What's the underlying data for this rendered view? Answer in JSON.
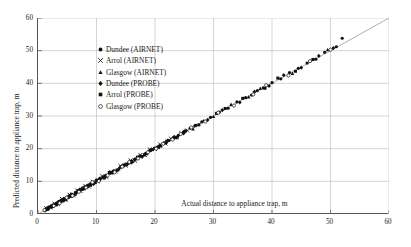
{
  "chart_data": {
    "type": "scatter",
    "title": "",
    "xlabel": "Actual distance to appliance trap, m",
    "ylabel": "Predicted distance to appliance trap, m",
    "xlim": [
      0,
      60
    ],
    "ylim": [
      0,
      60
    ],
    "xticks": [
      0,
      10,
      20,
      30,
      40,
      50,
      60
    ],
    "yticks": [
      0,
      10,
      20,
      30,
      40,
      50,
      60
    ],
    "grid": true,
    "legend_position": "upper-left-inside",
    "reference_line": {
      "name": "1:1 line",
      "from": [
        0,
        0
      ],
      "to": [
        60,
        60
      ],
      "color": "#8c8c8c"
    },
    "series": [
      {
        "name": "Dundee (AIRNET)",
        "marker": "filled-circle",
        "color": "#111111",
        "points": [
          [
            1.2,
            1.0
          ],
          [
            1.5,
            1.4
          ],
          [
            1.8,
            1.6
          ],
          [
            2.0,
            2.2
          ],
          [
            2.3,
            2.1
          ],
          [
            2.6,
            2.8
          ],
          [
            3.0,
            3.1
          ],
          [
            3.2,
            2.9
          ],
          [
            3.5,
            3.6
          ],
          [
            3.8,
            4.0
          ],
          [
            4.0,
            3.8
          ],
          [
            4.3,
            4.5
          ],
          [
            4.6,
            4.4
          ],
          [
            5.0,
            5.2
          ],
          [
            5.2,
            5.0
          ],
          [
            5.5,
            5.7
          ],
          [
            5.8,
            6.0
          ],
          [
            6.0,
            5.8
          ],
          [
            6.4,
            6.6
          ],
          [
            6.8,
            7.0
          ],
          [
            7.2,
            7.4
          ],
          [
            7.6,
            7.5
          ],
          [
            8.0,
            8.3
          ],
          [
            8.4,
            8.2
          ],
          [
            8.8,
            9.0
          ],
          [
            9.2,
            9.4
          ],
          [
            9.6,
            9.5
          ],
          [
            10.0,
            10.4
          ],
          [
            10.6,
            10.6
          ],
          [
            11.2,
            11.4
          ],
          [
            11.8,
            11.9
          ],
          [
            12.4,
            12.5
          ],
          [
            13.0,
            13.2
          ],
          [
            13.6,
            13.5
          ],
          [
            14.2,
            14.4
          ],
          [
            14.8,
            15.0
          ],
          [
            15.4,
            15.5
          ],
          [
            16.0,
            16.2
          ],
          [
            16.8,
            16.9
          ],
          [
            17.6,
            17.7
          ],
          [
            18.4,
            18.6
          ],
          [
            19.2,
            19.4
          ],
          [
            20.0,
            20.2
          ],
          [
            20.8,
            20.9
          ],
          [
            21.6,
            21.8
          ],
          [
            22.4,
            22.5
          ],
          [
            23.2,
            23.4
          ],
          [
            24.0,
            24.1
          ],
          [
            25.0,
            25.2
          ],
          [
            26.0,
            26.3
          ],
          [
            27.0,
            27.1
          ],
          [
            28.0,
            28.2
          ],
          [
            29.5,
            29.6
          ],
          [
            31.0,
            31.2
          ],
          [
            32.5,
            32.4
          ],
          [
            34.0,
            34.3
          ],
          [
            35.5,
            35.6
          ],
          [
            36.5,
            36.4
          ],
          [
            37.5,
            37.8
          ],
          [
            38.5,
            38.6
          ],
          [
            40.0,
            40.2
          ],
          [
            41.5,
            41.4
          ],
          [
            43.0,
            43.3
          ],
          [
            44.5,
            44.6
          ],
          [
            46.0,
            46.2
          ],
          [
            47.5,
            47.4
          ],
          [
            49.0,
            49.5
          ],
          [
            51.0,
            51.2
          ],
          [
            52.0,
            53.8
          ]
        ]
      },
      {
        "name": "Arrol (AIRNET)",
        "marker": "cross",
        "color": "#111111",
        "points": [
          [
            1.4,
            1.8
          ],
          [
            2.1,
            2.0
          ],
          [
            2.8,
            3.2
          ],
          [
            3.4,
            3.0
          ],
          [
            4.1,
            4.6
          ],
          [
            4.7,
            4.3
          ],
          [
            5.4,
            5.9
          ],
          [
            6.1,
            5.7
          ],
          [
            6.7,
            7.2
          ],
          [
            7.3,
            7.0
          ],
          [
            8.1,
            8.6
          ],
          [
            8.7,
            8.4
          ],
          [
            9.4,
            9.9
          ],
          [
            10.2,
            10.0
          ],
          [
            11.0,
            11.6
          ],
          [
            11.7,
            11.3
          ],
          [
            12.5,
            12.9
          ],
          [
            13.3,
            13.0
          ],
          [
            14.1,
            14.7
          ],
          [
            15.0,
            14.8
          ],
          [
            15.8,
            16.4
          ],
          [
            16.6,
            16.3
          ],
          [
            17.5,
            18.1
          ],
          [
            18.3,
            18.0
          ],
          [
            19.1,
            19.8
          ],
          [
            20.0,
            19.9
          ],
          [
            20.9,
            21.3
          ],
          [
            21.8,
            21.6
          ],
          [
            22.7,
            23.1
          ],
          [
            23.6,
            23.4
          ],
          [
            24.5,
            24.8
          ],
          [
            25.5,
            25.6
          ]
        ]
      },
      {
        "name": "Glasgow (AIRNET)",
        "marker": "triangle",
        "color": "#111111",
        "points": [
          [
            1.6,
            1.3
          ],
          [
            2.4,
            2.6
          ],
          [
            3.1,
            2.8
          ],
          [
            3.9,
            4.2
          ],
          [
            4.8,
            4.5
          ],
          [
            5.6,
            6.1
          ],
          [
            6.3,
            6.0
          ],
          [
            7.1,
            7.6
          ],
          [
            7.9,
            7.7
          ],
          [
            8.9,
            9.3
          ],
          [
            9.8,
            9.6
          ],
          [
            10.8,
            11.1
          ],
          [
            11.6,
            11.5
          ],
          [
            12.7,
            13.0
          ],
          [
            13.8,
            13.7
          ],
          [
            14.9,
            15.3
          ],
          [
            16.2,
            16.0
          ],
          [
            17.3,
            17.8
          ],
          [
            18.6,
            18.4
          ],
          [
            19.8,
            20.1
          ],
          [
            21.0,
            20.8
          ],
          [
            22.2,
            22.6
          ],
          [
            23.5,
            23.3
          ],
          [
            24.8,
            25.1
          ],
          [
            26.5,
            26.0
          ],
          [
            28.3,
            28.5
          ],
          [
            30.0,
            29.8
          ],
          [
            33.0,
            33.5
          ],
          [
            36.0,
            35.8
          ],
          [
            38.0,
            38.4
          ],
          [
            43.5,
            43.0
          ],
          [
            49.5,
            50.2
          ]
        ]
      },
      {
        "name": "Dundee (PROBE)",
        "marker": "diamond",
        "color": "#111111",
        "points": [
          [
            1.3,
            1.5
          ],
          [
            2.2,
            2.4
          ],
          [
            3.3,
            3.4
          ],
          [
            4.4,
            4.1
          ],
          [
            5.3,
            5.5
          ],
          [
            6.5,
            6.3
          ],
          [
            7.5,
            7.8
          ],
          [
            8.5,
            8.7
          ],
          [
            9.5,
            9.2
          ],
          [
            10.5,
            10.8
          ],
          [
            11.5,
            11.7
          ],
          [
            12.8,
            12.6
          ],
          [
            14.0,
            14.2
          ],
          [
            15.2,
            15.1
          ],
          [
            16.5,
            16.7
          ],
          [
            17.8,
            17.5
          ],
          [
            19.0,
            19.3
          ],
          [
            20.4,
            20.5
          ],
          [
            21.9,
            21.7
          ],
          [
            23.3,
            23.6
          ],
          [
            24.9,
            24.7
          ],
          [
            26.8,
            27.0
          ],
          [
            29.0,
            28.8
          ],
          [
            31.5,
            31.8
          ],
          [
            34.5,
            34.2
          ],
          [
            37.0,
            37.4
          ],
          [
            39.5,
            39.2
          ],
          [
            42.0,
            42.5
          ],
          [
            45.0,
            44.8
          ],
          [
            48.0,
            48.4
          ],
          [
            50.5,
            50.8
          ]
        ]
      },
      {
        "name": "Arrol (PROBE)",
        "marker": "filled-square",
        "color": "#111111",
        "points": [
          [
            1.7,
            1.9
          ],
          [
            2.5,
            2.3
          ],
          [
            3.6,
            3.8
          ],
          [
            4.5,
            4.7
          ],
          [
            5.7,
            5.4
          ],
          [
            6.9,
            7.1
          ],
          [
            7.8,
            8.0
          ],
          [
            9.0,
            8.8
          ],
          [
            10.1,
            10.3
          ],
          [
            11.3,
            11.0
          ],
          [
            12.2,
            12.7
          ],
          [
            13.5,
            13.4
          ],
          [
            14.6,
            14.9
          ],
          [
            15.9,
            15.7
          ],
          [
            17.0,
            17.4
          ],
          [
            18.2,
            18.1
          ],
          [
            19.5,
            19.7
          ],
          [
            20.6,
            20.4
          ],
          [
            22.0,
            22.3
          ],
          [
            23.8,
            23.5
          ],
          [
            25.2,
            25.4
          ],
          [
            27.5,
            27.3
          ],
          [
            30.5,
            30.8
          ],
          [
            32.0,
            32.3
          ],
          [
            35.0,
            35.4
          ],
          [
            38.8,
            38.5
          ],
          [
            41.0,
            41.6
          ],
          [
            44.0,
            43.7
          ],
          [
            47.0,
            47.3
          ]
        ]
      },
      {
        "name": "Glasgow (PROBE)",
        "marker": "open-circle",
        "color": "#111111",
        "points": [
          [
            1.1,
            1.2
          ],
          [
            2.7,
            2.5
          ],
          [
            3.7,
            3.3
          ],
          [
            4.9,
            5.0
          ],
          [
            5.9,
            5.6
          ],
          [
            7.0,
            6.8
          ],
          [
            8.2,
            8.1
          ],
          [
            9.3,
            9.7
          ],
          [
            10.4,
            10.1
          ],
          [
            11.9,
            11.8
          ],
          [
            13.1,
            12.8
          ],
          [
            14.4,
            14.5
          ],
          [
            15.6,
            15.9
          ],
          [
            17.1,
            17.0
          ],
          [
            18.8,
            18.9
          ],
          [
            20.2,
            20.0
          ],
          [
            21.4,
            21.5
          ],
          [
            23.0,
            22.8
          ],
          [
            24.4,
            24.5
          ],
          [
            26.2,
            26.5
          ],
          [
            28.6,
            28.3
          ],
          [
            30.8,
            31.0
          ],
          [
            33.5,
            33.2
          ],
          [
            36.8,
            36.6
          ],
          [
            39.0,
            39.4
          ],
          [
            42.8,
            42.4
          ],
          [
            46.5,
            46.8
          ],
          [
            50.0,
            50.3
          ]
        ]
      }
    ]
  }
}
